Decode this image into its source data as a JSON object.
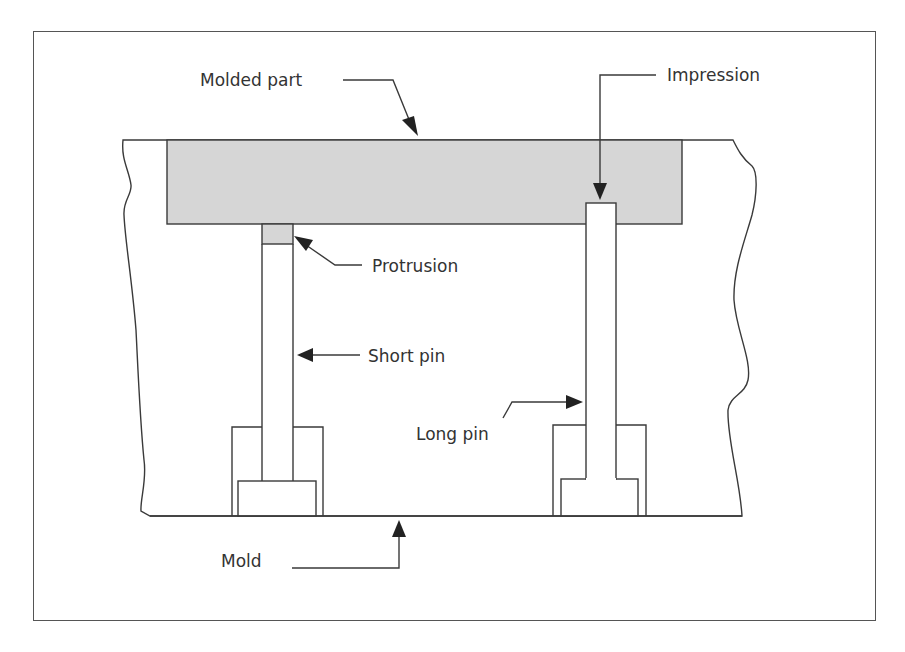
{
  "figure": {
    "type": "cross-section diagram"
  },
  "labels": {
    "molded_part": "Molded part",
    "impression": "Impression",
    "protrusion": "Protrusion",
    "short_pin": "Short pin",
    "long_pin": "Long pin",
    "mold": "Mold"
  },
  "colors": {
    "line": "#3a3a3a",
    "molded_part_fill": "#d6d6d6",
    "frame_border": "#555555",
    "text": "#333333",
    "background": "#ffffff"
  },
  "components": [
    {
      "id": "mold",
      "label_key": "mold"
    },
    {
      "id": "molded-part",
      "label_key": "molded_part"
    },
    {
      "id": "short-pin",
      "label_key": "short_pin",
      "feature": "protrusion"
    },
    {
      "id": "long-pin",
      "label_key": "long_pin",
      "feature": "impression"
    }
  ]
}
